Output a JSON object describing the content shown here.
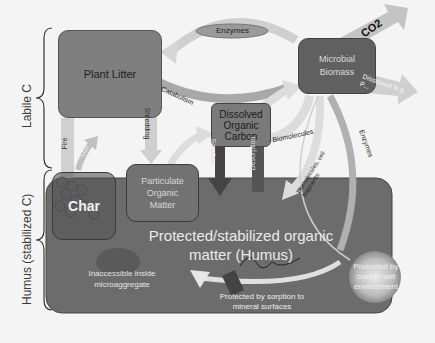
{
  "side_labels": {
    "labile": "Labile C",
    "humus": "Humus (stabilized  C)"
  },
  "nodes": {
    "plant_litter": "Plant Litter",
    "microbial_biomass": "Microbial Biomass",
    "doc": "Dissolved Organic Carbon",
    "particulate": "Particulate Organic Matter",
    "char": "Char",
    "humus_title_1": "Protected/stabilized organic",
    "humus_title_2": "matter (Humus)",
    "inaccessible": "Inaccessible inside microaggregate",
    "sorption_protect": "Protected by sorption to  mineral surfaces",
    "cold_wet": "Protected by cold or wet environment"
  },
  "arrows": {
    "enzymes_top": "Enzymes",
    "catabolism": "Catabolism",
    "co2_top": "CO2",
    "dissolved_n": "Dissolved N & P...",
    "enzymes_right": "Enzymes",
    "biomolecules": "Biomolecules",
    "biomolecules_cell": "Biomolecules, cell fragments",
    "sorption": "Sorption",
    "desorption": "Desorption",
    "shredding": "Shredding",
    "fire": "Fire",
    "co2_fire": "CO2"
  },
  "colors": {
    "box_fill": "#7a7a7a",
    "humus_fill": "#6c6c6c",
    "arrow_light": "#d6d6d6",
    "background": "#f4f4f4"
  }
}
